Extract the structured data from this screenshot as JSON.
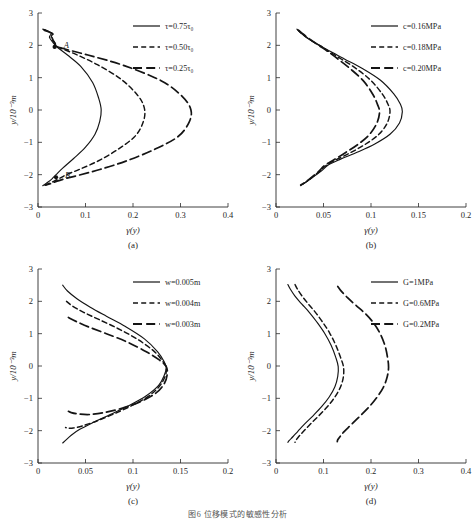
{
  "figure": {
    "caption": "图6   位移模式的敏感性分析",
    "panels": [
      "a",
      "b",
      "c",
      "d"
    ]
  },
  "axis_common": {
    "ylabel": "y/10⁻³m",
    "xlabel": "γ(y)",
    "yticks": [
      "3",
      "2",
      "1",
      "0",
      "-1",
      "-2",
      "-3"
    ],
    "ylim": [
      -3,
      3
    ]
  },
  "chart_data": [
    {
      "type": "line",
      "panel": "a",
      "title": "",
      "xlabel": "γ(y)",
      "ylabel": "y/10⁻³m",
      "xlim": [
        0,
        0.4
      ],
      "ylim": [
        -3,
        3
      ],
      "xticks": [
        0,
        0.1,
        0.2,
        0.3,
        0.4
      ],
      "xticklabels": [
        "0",
        "0.1",
        "0.2",
        "0.3",
        "0.4"
      ],
      "yticks": [
        -3,
        -2,
        -1,
        0,
        1,
        2,
        3
      ],
      "yticklabels": [
        "-3",
        "-2",
        "-1",
        "0",
        "1",
        "2",
        "3"
      ],
      "grid": false,
      "legend_position": "top-right",
      "annotations": [
        {
          "label": "A",
          "x": 0.035,
          "y": 1.95,
          "marker": true
        },
        {
          "label": "B",
          "x": 0.038,
          "y": -2.08,
          "marker": true
        }
      ],
      "series": [
        {
          "name": "τ=0.75τ₀",
          "style": "solid",
          "x": [
            0.01,
            0.018,
            0.028,
            0.024,
            0.031,
            0.04,
            0.062,
            0.09,
            0.115,
            0.128,
            0.133,
            0.13,
            0.12,
            0.1,
            0.075,
            0.052,
            0.038,
            0.03,
            0.022,
            0.014,
            0.01
          ],
          "y": [
            2.5,
            2.46,
            2.38,
            2.25,
            2.1,
            1.95,
            1.7,
            1.35,
            0.85,
            0.35,
            0.0,
            -0.35,
            -0.75,
            -1.15,
            -1.5,
            -1.8,
            -2.0,
            -2.12,
            -2.22,
            -2.3,
            -2.34
          ]
        },
        {
          "name": "τ=0.50τ₀",
          "style": "dashed-short",
          "x": [
            0.012,
            0.02,
            0.03,
            0.028,
            0.035,
            0.042,
            0.08,
            0.125,
            0.175,
            0.21,
            0.224,
            0.222,
            0.205,
            0.17,
            0.13,
            0.09,
            0.06,
            0.045,
            0.034,
            0.022,
            0.014
          ],
          "y": [
            2.48,
            2.44,
            2.36,
            2.24,
            2.08,
            1.95,
            1.72,
            1.4,
            0.95,
            0.45,
            0.05,
            -0.35,
            -0.8,
            -1.2,
            -1.55,
            -1.82,
            -2.0,
            -2.12,
            -2.2,
            -2.28,
            -2.33
          ]
        },
        {
          "name": "τ=0.25τ₀",
          "style": "dashed-long",
          "x": [
            0.014,
            0.022,
            0.032,
            0.03,
            0.036,
            0.044,
            0.105,
            0.18,
            0.26,
            0.305,
            0.322,
            0.318,
            0.295,
            0.245,
            0.185,
            0.13,
            0.085,
            0.058,
            0.04,
            0.026,
            0.016
          ],
          "y": [
            2.46,
            2.42,
            2.34,
            2.22,
            2.06,
            1.94,
            1.7,
            1.38,
            0.9,
            0.4,
            0.0,
            -0.38,
            -0.82,
            -1.22,
            -1.58,
            -1.84,
            -2.02,
            -2.12,
            -2.2,
            -2.28,
            -2.32
          ]
        }
      ]
    },
    {
      "type": "line",
      "panel": "b",
      "title": "",
      "xlabel": "γ(y)",
      "ylabel": "y/10⁻³m",
      "xlim": [
        0,
        0.2
      ],
      "ylim": [
        -3,
        3
      ],
      "xticks": [
        0,
        0.05,
        0.1,
        0.15,
        0.2
      ],
      "xticklabels": [
        "0",
        "0.05",
        "0.1",
        "0.15",
        "0.2"
      ],
      "yticks": [
        -3,
        -2,
        -1,
        0,
        1,
        2,
        3
      ],
      "yticklabels": [
        "-3",
        "-2",
        "-1",
        "0",
        "1",
        "2",
        "3"
      ],
      "grid": false,
      "legend_position": "top-right",
      "annotations": [],
      "series": [
        {
          "name": "c=0.16MPa",
          "style": "solid",
          "x": [
            0.022,
            0.026,
            0.034,
            0.046,
            0.058,
            0.072,
            0.09,
            0.11,
            0.124,
            0.131,
            0.133,
            0.13,
            0.12,
            0.104,
            0.086,
            0.068,
            0.055,
            0.048,
            0.04,
            0.032,
            0.026
          ],
          "y": [
            2.5,
            2.38,
            2.2,
            2.0,
            1.8,
            1.58,
            1.3,
            0.92,
            0.5,
            0.18,
            -0.05,
            -0.4,
            -0.75,
            -1.05,
            -1.3,
            -1.52,
            -1.7,
            -1.88,
            -2.05,
            -2.22,
            -2.34
          ]
        },
        {
          "name": "c=0.18MPa",
          "style": "dashed-short",
          "x": [
            0.023,
            0.027,
            0.035,
            0.046,
            0.057,
            0.069,
            0.084,
            0.1,
            0.112,
            0.118,
            0.12,
            0.117,
            0.108,
            0.094,
            0.079,
            0.064,
            0.053,
            0.046,
            0.039,
            0.032,
            0.026
          ],
          "y": [
            2.48,
            2.37,
            2.19,
            1.99,
            1.79,
            1.57,
            1.29,
            0.91,
            0.49,
            0.17,
            -0.06,
            -0.41,
            -0.76,
            -1.06,
            -1.31,
            -1.53,
            -1.71,
            -1.89,
            -2.06,
            -2.22,
            -2.33
          ]
        },
        {
          "name": "c=0.20MPa",
          "style": "dashed-long",
          "x": [
            0.024,
            0.028,
            0.036,
            0.046,
            0.056,
            0.066,
            0.078,
            0.092,
            0.102,
            0.107,
            0.109,
            0.106,
            0.098,
            0.086,
            0.073,
            0.061,
            0.051,
            0.045,
            0.038,
            0.031,
            0.026
          ],
          "y": [
            2.46,
            2.36,
            2.18,
            1.98,
            1.78,
            1.56,
            1.28,
            0.9,
            0.48,
            0.16,
            -0.07,
            -0.42,
            -0.77,
            -1.07,
            -1.32,
            -1.54,
            -1.72,
            -1.9,
            -2.07,
            -2.23,
            -2.32
          ]
        }
      ]
    },
    {
      "type": "line",
      "panel": "c",
      "title": "",
      "xlabel": "γ(y)",
      "ylabel": "y/10⁻³m",
      "xlim": [
        0,
        0.2
      ],
      "ylim": [
        -3,
        3
      ],
      "xticks": [
        0,
        0.05,
        0.1,
        0.15,
        0.2
      ],
      "xticklabels": [
        "0",
        "0.05",
        "0.1",
        "0.15",
        "0.2"
      ],
      "yticks": [
        -3,
        -2,
        -1,
        0,
        1,
        2,
        3
      ],
      "yticklabels": [
        "-3",
        "-2",
        "-1",
        "0",
        "1",
        "2",
        "3"
      ],
      "grid": false,
      "legend_position": "top-right",
      "annotations": [],
      "series": [
        {
          "name": "w=0.005m",
          "style": "solid",
          "x": [
            0.026,
            0.031,
            0.041,
            0.055,
            0.072,
            0.092,
            0.112,
            0.126,
            0.133,
            0.135,
            0.133,
            0.127,
            0.114,
            0.096,
            0.076,
            0.058,
            0.044,
            0.035,
            0.029,
            0.026
          ],
          "y": [
            2.5,
            2.32,
            2.08,
            1.82,
            1.54,
            1.22,
            0.84,
            0.44,
            0.12,
            -0.05,
            -0.28,
            -0.6,
            -0.92,
            -1.22,
            -1.5,
            -1.75,
            -1.96,
            -2.14,
            -2.3,
            -2.38
          ]
        },
        {
          "name": "w=0.004m",
          "style": "dashed-short",
          "x": [
            0.03,
            0.036,
            0.048,
            0.064,
            0.084,
            0.104,
            0.122,
            0.131,
            0.135,
            0.134,
            0.128,
            0.116,
            0.099,
            0.08,
            0.062,
            0.047,
            0.037,
            0.031,
            0.029
          ],
          "y": [
            2.0,
            1.86,
            1.66,
            1.44,
            1.16,
            0.84,
            0.46,
            0.16,
            -0.05,
            -0.3,
            -0.62,
            -0.94,
            -1.22,
            -1.48,
            -1.7,
            -1.85,
            -1.92,
            -1.92,
            -1.9
          ]
        },
        {
          "name": "w=0.003m",
          "style": "dashed-long",
          "x": [
            0.032,
            0.04,
            0.054,
            0.072,
            0.094,
            0.114,
            0.128,
            0.135,
            0.136,
            0.133,
            0.124,
            0.108,
            0.089,
            0.07,
            0.054,
            0.042,
            0.035,
            0.032
          ],
          "y": [
            1.5,
            1.38,
            1.2,
            1.0,
            0.74,
            0.44,
            0.18,
            -0.02,
            -0.26,
            -0.54,
            -0.84,
            -1.1,
            -1.3,
            -1.44,
            -1.5,
            -1.48,
            -1.44,
            -1.4
          ]
        }
      ]
    },
    {
      "type": "line",
      "panel": "d",
      "title": "",
      "xlabel": "γ(y)",
      "ylabel": "y/10⁻³m",
      "xlim": [
        0,
        0.4
      ],
      "ylim": [
        -3,
        3
      ],
      "xticks": [
        0,
        0.1,
        0.2,
        0.3,
        0.4
      ],
      "xticklabels": [
        "0",
        "0.1",
        "0.2",
        "0.3",
        "0.4"
      ],
      "yticks": [
        -3,
        -2,
        -1,
        0,
        1,
        2,
        3
      ],
      "yticklabels": [
        "-3",
        "-2",
        "-1",
        "0",
        "1",
        "2",
        "3"
      ],
      "grid": false,
      "legend_position": "top-right",
      "annotations": [],
      "series": [
        {
          "name": "G=1MPa",
          "style": "solid",
          "x": [
            0.025,
            0.03,
            0.04,
            0.054,
            0.07,
            0.086,
            0.102,
            0.116,
            0.126,
            0.131,
            0.13,
            0.124,
            0.112,
            0.096,
            0.078,
            0.06,
            0.046,
            0.036,
            0.028,
            0.025
          ],
          "y": [
            2.52,
            2.38,
            2.16,
            1.92,
            1.66,
            1.36,
            1.02,
            0.64,
            0.26,
            -0.02,
            -0.32,
            -0.64,
            -0.96,
            -1.26,
            -1.54,
            -1.8,
            -2.02,
            -2.18,
            -2.3,
            -2.36
          ]
        },
        {
          "name": "G=0.6MPa",
          "style": "dashed-short",
          "x": [
            0.04,
            0.045,
            0.055,
            0.068,
            0.083,
            0.098,
            0.113,
            0.126,
            0.136,
            0.142,
            0.142,
            0.136,
            0.124,
            0.108,
            0.09,
            0.072,
            0.058,
            0.048,
            0.042,
            0.04
          ],
          "y": [
            2.52,
            2.38,
            2.16,
            1.92,
            1.66,
            1.36,
            1.02,
            0.64,
            0.26,
            -0.02,
            -0.32,
            -0.64,
            -0.96,
            -1.26,
            -1.54,
            -1.8,
            -2.02,
            -2.18,
            -2.3,
            -2.36
          ]
        },
        {
          "name": "G=0.2MPa",
          "style": "dashed-long",
          "x": [
            0.13,
            0.136,
            0.15,
            0.168,
            0.188,
            0.206,
            0.22,
            0.23,
            0.235,
            0.237,
            0.234,
            0.226,
            0.212,
            0.195,
            0.176,
            0.158,
            0.144,
            0.135,
            0.13,
            0.129
          ],
          "y": [
            2.46,
            2.34,
            2.12,
            1.88,
            1.62,
            1.32,
            0.98,
            0.6,
            0.24,
            -0.04,
            -0.34,
            -0.66,
            -0.98,
            -1.28,
            -1.56,
            -1.82,
            -2.02,
            -2.18,
            -2.28,
            -2.34
          ]
        }
      ]
    }
  ]
}
